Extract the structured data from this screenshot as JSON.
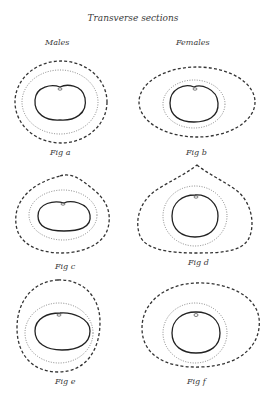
{
  "title": "Transverse sections",
  "columns": {
    "left": "Males",
    "right": "Females"
  },
  "figures": [
    {
      "id": "a",
      "label": "Fig a",
      "group": "Males"
    },
    {
      "id": "b",
      "label": "Fig b",
      "group": "Females"
    },
    {
      "id": "c",
      "label": "Fig c",
      "group": "Males"
    },
    {
      "id": "d",
      "label": "Fig d",
      "group": "Females"
    },
    {
      "id": "e",
      "label": "Fig e",
      "group": "Males"
    },
    {
      "id": "f",
      "label": "Fig f",
      "group": "Females"
    }
  ],
  "legend": {
    "outer_line": "dashed",
    "middle_line": "dotted",
    "inner_line": "solid"
  },
  "colors": {
    "ink": "#333333",
    "background": "#ffffff"
  }
}
